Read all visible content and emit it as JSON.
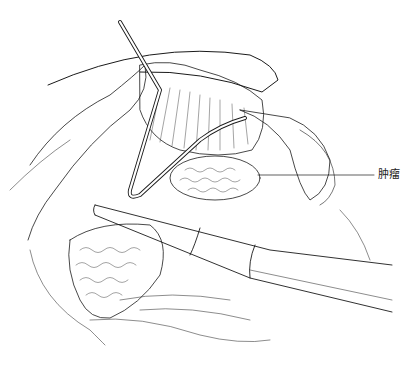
{
  "figure": {
    "type": "surgical line illustration",
    "annotations": [
      {
        "text": "肿瘤",
        "meaning": "tumor",
        "leader_from": [
          258,
          175
        ],
        "leader_to": [
          374,
          175
        ]
      }
    ]
  },
  "colors": {
    "ink": "#1a1a1a",
    "background": "#ffffff"
  }
}
